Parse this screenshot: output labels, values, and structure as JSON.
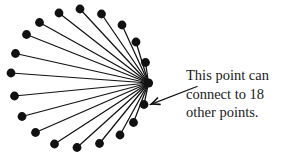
{
  "figure": {
    "background_color": "#ffffff",
    "ink_color": "#111111",
    "width": 284,
    "height": 156
  },
  "hub": {
    "label": "central-point",
    "x": 148.5,
    "y": 83.0,
    "radius": 4.6,
    "connection_count": 18
  },
  "outer_points": [
    {
      "id": 1,
      "x": 59.0,
      "y": 13.0,
      "radius": 4.4
    },
    {
      "id": 2,
      "x": 80.0,
      "y": 9.0,
      "radius": 4.4
    },
    {
      "id": 3,
      "x": 101.5,
      "y": 14.0,
      "radius": 4.4
    },
    {
      "id": 4,
      "x": 122.0,
      "y": 25.0,
      "radius": 4.4
    },
    {
      "id": 5,
      "x": 136.0,
      "y": 42.0,
      "radius": 4.4
    },
    {
      "id": 6,
      "x": 145.5,
      "y": 62.5,
      "radius": 4.4
    },
    {
      "id": 7,
      "x": 39.5,
      "y": 22.5,
      "radius": 4.4
    },
    {
      "id": 8,
      "x": 26.5,
      "y": 34.5,
      "radius": 4.4
    },
    {
      "id": 9,
      "x": 15.5,
      "y": 53.5,
      "radius": 4.4
    },
    {
      "id": 10,
      "x": 11.0,
      "y": 73.0,
      "radius": 4.4
    },
    {
      "id": 11,
      "x": 14.5,
      "y": 96.0,
      "radius": 4.4
    },
    {
      "id": 12,
      "x": 22.0,
      "y": 116.5,
      "radius": 4.4
    },
    {
      "id": 13,
      "x": 35.5,
      "y": 132.5,
      "radius": 4.4
    },
    {
      "id": 14,
      "x": 54.5,
      "y": 144.0,
      "radius": 4.4
    },
    {
      "id": 15,
      "x": 77.0,
      "y": 147.5,
      "radius": 4.4
    },
    {
      "id": 16,
      "x": 99.5,
      "y": 143.5,
      "radius": 4.4
    },
    {
      "id": 17,
      "x": 120.0,
      "y": 135.0,
      "radius": 4.4
    },
    {
      "id": 18,
      "x": 133.5,
      "y": 122.5,
      "radius": 4.4
    }
  ],
  "extra_point": {
    "id": 19,
    "x": 144.0,
    "y": 104.5,
    "radius": 4.4
  },
  "arrow": {
    "tail_x": 197.0,
    "tail_y": 86.5,
    "tip_x": 151.5,
    "tip_y": 104.0,
    "head_size": 8.5,
    "stroke_width": 1.3
  },
  "caption": {
    "lines": [
      "This point can",
      "connect to 18",
      "other points."
    ],
    "line1": "This point can",
    "line2": "connect to 18",
    "line3": "other points."
  },
  "chart_data": {
    "type": "diagram",
    "title": "",
    "center_degree": 18,
    "vertex_count": 19,
    "edge_count": 18
  }
}
